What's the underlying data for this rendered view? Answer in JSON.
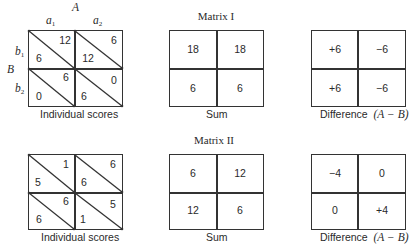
{
  "labels": {
    "player_A": "A",
    "player_B": "B",
    "a1": "a",
    "a1_sub": "1",
    "a2": "a",
    "a2_sub": "2",
    "b1": "b",
    "b1_sub": "1",
    "b2": "b",
    "b2_sub": "2"
  },
  "matrices": [
    {
      "title": "Matrix I",
      "individual": {
        "caption": "Individual scores",
        "cells": [
          {
            "A": "12",
            "B": "6"
          },
          {
            "A": "6",
            "B": "12"
          },
          {
            "A": "6",
            "B": "0"
          },
          {
            "A": "0",
            "B": "6"
          }
        ]
      },
      "sum": {
        "caption": "Sum",
        "cells": [
          "18",
          "18",
          "6",
          "6"
        ]
      },
      "difference": {
        "caption": "Difference",
        "caption_formula": "(A − B)",
        "cells": [
          "+6",
          "−6",
          "+6",
          "−6"
        ]
      }
    },
    {
      "title": "Matrix II",
      "individual": {
        "caption": "Individual scores",
        "cells": [
          {
            "A": "1",
            "B": "5"
          },
          {
            "A": "6",
            "B": "6"
          },
          {
            "A": "6",
            "B": "6"
          },
          {
            "A": "5",
            "B": "1"
          }
        ]
      },
      "sum": {
        "caption": "Sum",
        "cells": [
          "6",
          "12",
          "12",
          "6"
        ]
      },
      "difference": {
        "caption": "Difference",
        "caption_formula": "(A − B)",
        "cells": [
          "−4",
          "0",
          "0",
          "+4"
        ]
      }
    }
  ]
}
